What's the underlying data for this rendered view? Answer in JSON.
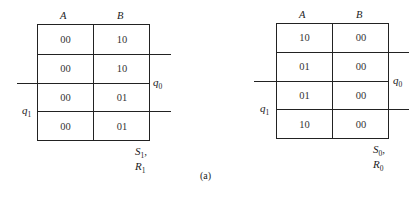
{
  "maps": [
    {
      "columns": [
        "A",
        "B"
      ],
      "cells": [
        [
          "00",
          "10"
        ],
        [
          "00",
          "10"
        ],
        [
          "00",
          "01"
        ],
        [
          "00",
          "01"
        ]
      ],
      "row_var_right": {
        "base": "q",
        "sub": "0"
      },
      "row_var_left": {
        "base": "q",
        "sub": "1"
      },
      "output_label": {
        "s": "S",
        "s_sub": "1",
        "r": "R",
        "r_sub": "1"
      }
    },
    {
      "columns": [
        "A",
        "B"
      ],
      "cells": [
        [
          "10",
          "00"
        ],
        [
          "01",
          "00"
        ],
        [
          "01",
          "00"
        ],
        [
          "10",
          "00"
        ]
      ],
      "row_var_right": {
        "base": "q",
        "sub": "0"
      },
      "row_var_left": {
        "base": "q",
        "sub": "1"
      },
      "output_label": {
        "s": "S",
        "s_sub": "0",
        "r": "R",
        "r_sub": "0"
      }
    }
  ],
  "caption": "(a)"
}
